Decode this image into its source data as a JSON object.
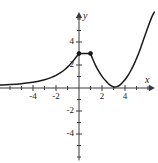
{
  "figure": {
    "kind": "cartesian-graph",
    "width": 158,
    "height": 163,
    "background": "#ffffff",
    "stroke_color": "#1a1a1a",
    "axis_color": "#3a3a3a"
  },
  "axes": {
    "x_axis_label": "x",
    "y_axis_label": "y",
    "origin_px": {
      "x": 79,
      "y": 88
    },
    "pixels_per_unit": 11.5,
    "x_range": [
      -6.9,
      6.6
    ],
    "y_range": [
      -6.3,
      6.6
    ],
    "x_tick_labels": [
      "-4",
      "-2",
      "2",
      "4"
    ],
    "x_tick_values": [
      -4,
      -2,
      2,
      4
    ],
    "y_tick_labels": [
      "4",
      "2",
      "-2",
      "-4"
    ],
    "y_tick_values": [
      4,
      2,
      -2,
      -4
    ],
    "minor_tick_step": 1,
    "grid": false,
    "arrowheads": [
      "x-positive",
      "y-positive"
    ]
  },
  "chart_data": {
    "type": "line",
    "title": "",
    "xlabel": "x",
    "ylabel": "y",
    "xlim": [
      -6.9,
      6.6
    ],
    "ylim": [
      -6.3,
      6.6
    ],
    "grid": false,
    "legend": "none",
    "series": [
      {
        "name": "left-branch",
        "description": "increasing concave-up curve approaching y=0 as x decreases, reaching (0, 3)",
        "x": [
          -6.9,
          -6.0,
          -5.0,
          -4.0,
          -3.0,
          -2.4,
          -2.0,
          -1.6,
          -1.2,
          -0.9,
          -0.6,
          -0.35,
          -0.15,
          0.0
        ],
        "y": [
          0.25,
          0.3,
          0.38,
          0.5,
          0.72,
          0.92,
          1.1,
          1.33,
          1.63,
          1.92,
          2.25,
          2.55,
          2.8,
          3.0
        ]
      },
      {
        "name": "flat-segment",
        "description": "horizontal segment at y=3 from x=0 to x=1 with endpoint dots",
        "x": [
          0.0,
          1.0
        ],
        "y": [
          3.0,
          3.0
        ]
      },
      {
        "name": "right-branch",
        "description": "curve descending from (1,3) to a minimum near (3,0) then rising steeply",
        "x": [
          1.0,
          1.2,
          1.45,
          1.75,
          2.05,
          2.35,
          2.65,
          3.0,
          3.3,
          3.6,
          3.9,
          4.2,
          4.5,
          4.8,
          5.1,
          5.4,
          5.7,
          6.0,
          6.3,
          6.55
        ],
        "y": [
          3.0,
          2.5,
          1.95,
          1.4,
          0.95,
          0.6,
          0.3,
          0.1,
          0.12,
          0.3,
          0.6,
          1.0,
          1.5,
          2.1,
          2.8,
          3.6,
          4.45,
          5.3,
          6.1,
          6.6
        ]
      }
    ],
    "markers": [
      {
        "name": "left-endpoint-dot",
        "x": 0.0,
        "y": 3.0,
        "filled": true
      },
      {
        "name": "right-endpoint-dot",
        "x": 1.0,
        "y": 3.0,
        "filled": true
      }
    ]
  }
}
